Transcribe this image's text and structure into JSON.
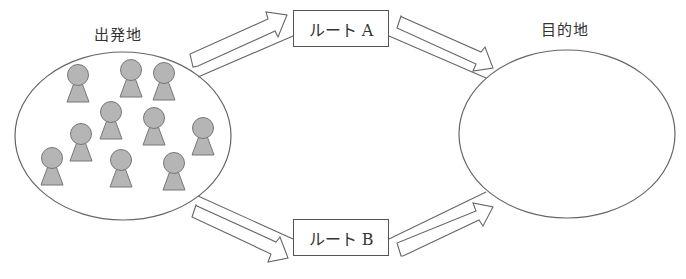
{
  "diagram": {
    "origin": {
      "label": "出発地",
      "people_count": 10
    },
    "destination": {
      "label": "目的地"
    },
    "routes": [
      {
        "id": "A",
        "label": "ルート A"
      },
      {
        "id": "B",
        "label": "ルート B"
      }
    ],
    "colors": {
      "stroke": "#666666",
      "person_fill": "#b5b5b5",
      "person_stroke": "#777777",
      "background": "#ffffff"
    }
  }
}
